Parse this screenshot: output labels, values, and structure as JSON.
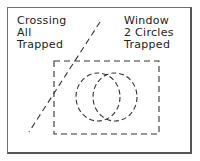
{
  "labels": {
    "crossing": [
      "Crossing",
      "All",
      "Trapped"
    ],
    "window": [
      "Window",
      "2 Circles",
      "Trapped"
    ]
  },
  "colors": {
    "stroke": "#333333",
    "frame": "#6e6e6e",
    "background": "#ffffff"
  },
  "shapes": {
    "crossing_line": {
      "x1": 100,
      "y1": 22,
      "x2": 29,
      "y2": 132,
      "style": "dashed"
    },
    "window_rect": {
      "x": 54,
      "y": 61,
      "width": 105,
      "height": 73,
      "style": "dashed"
    },
    "circles": [
      {
        "cx": 98,
        "cy": 97,
        "rx": 22,
        "ry": 24,
        "style": "dashed"
      },
      {
        "cx": 115,
        "cy": 97,
        "rx": 22,
        "ry": 24,
        "style": "dashed"
      }
    ]
  }
}
